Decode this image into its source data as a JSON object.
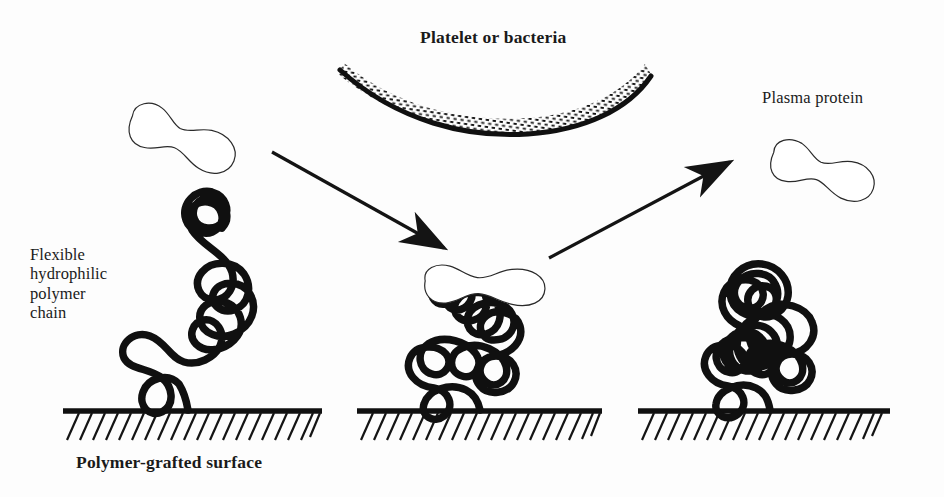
{
  "figure": {
    "title_label": "Platelet or bacteria",
    "background_color": "#fdfdfd",
    "ink_color": "#101010",
    "width": 944,
    "height": 497
  },
  "labels": {
    "platelet_or_bacteria": "Platelet or bacteria",
    "plasma_protein": "Plasma protein",
    "flexible_polymer_chain": "Flexible\nhydrophilic\npolymer\nchain",
    "polymer_grafted_surface": "Polymer-grafted surface"
  },
  "stages": [
    {
      "name": "approach",
      "description": "Extended flexible hydrophilic polymer chain on grafted surface",
      "ground_x_start": 63,
      "ground_x_end": 322,
      "ground_y": 411,
      "has_protein_adsorbed": false
    },
    {
      "name": "compressed",
      "description": "Plasma protein adsorbed on compressed polymer chain",
      "ground_x_start": 357,
      "ground_x_end": 602,
      "ground_y": 411,
      "has_protein_adsorbed": true
    },
    {
      "name": "released",
      "description": "Polymer chain recoiled after protein release",
      "ground_x_start": 638,
      "ground_x_end": 890,
      "ground_y": 411,
      "has_protein_adsorbed": false
    }
  ],
  "proteins": [
    {
      "name": "incoming-plasma-protein",
      "cx": 182,
      "cy": 140,
      "angle": 22
    },
    {
      "name": "adsorbed-plasma-protein",
      "cx": 485,
      "cy": 286,
      "angle": 3
    },
    {
      "name": "released-plasma-protein",
      "cx": 822,
      "cy": 172,
      "angle": 18
    }
  ],
  "arrows": [
    {
      "name": "adsorption-arrow",
      "x1": 272,
      "y1": 152,
      "x2": 452,
      "y2": 252,
      "direction": "down-right"
    },
    {
      "name": "desorption-arrow",
      "x1": 549,
      "y1": 258,
      "x2": 736,
      "y2": 158,
      "direction": "up-right"
    }
  ],
  "cell": {
    "name": "platelet-or-bacteria-membrane",
    "x_start": 343,
    "x_end": 646,
    "sag_y": 104,
    "edge_y": 62
  }
}
